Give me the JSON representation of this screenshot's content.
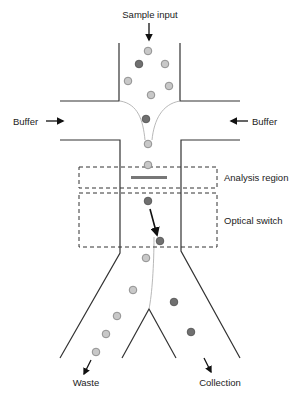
{
  "diagram": {
    "labels": {
      "sample_input": "Sample input",
      "buffer_left": "Buffer",
      "buffer_right": "Buffer",
      "analysis_region": "Analysis region",
      "optical_switch": "Optical switch",
      "waste": "Waste",
      "collection": "Collection"
    },
    "colors": {
      "wall": "#333333",
      "particle_light_fill": "#c8c8c8",
      "particle_light_stroke": "#888888",
      "particle_dark_fill": "#707070",
      "particle_dark_stroke": "#555555",
      "dashed_box": "#333333",
      "stream_line": "#b0b0b0",
      "detector_bar": "#777777"
    },
    "particles": [
      {
        "x": 148,
        "y": 51,
        "type": "light"
      },
      {
        "x": 139,
        "y": 64,
        "type": "dark"
      },
      {
        "x": 165,
        "y": 64,
        "type": "light"
      },
      {
        "x": 128,
        "y": 81,
        "type": "light"
      },
      {
        "x": 169,
        "y": 86,
        "type": "light"
      },
      {
        "x": 151,
        "y": 95,
        "type": "light"
      },
      {
        "x": 146,
        "y": 119,
        "type": "dark"
      },
      {
        "x": 148,
        "y": 144,
        "type": "light"
      },
      {
        "x": 148,
        "y": 165,
        "type": "light"
      },
      {
        "x": 148,
        "y": 201,
        "type": "dark"
      },
      {
        "x": 160,
        "y": 241,
        "type": "dark"
      },
      {
        "x": 146,
        "y": 258,
        "type": "light"
      },
      {
        "x": 133,
        "y": 290,
        "type": "light"
      },
      {
        "x": 117,
        "y": 316,
        "type": "light"
      },
      {
        "x": 106,
        "y": 334,
        "type": "light"
      },
      {
        "x": 96,
        "y": 352,
        "type": "light"
      },
      {
        "x": 174,
        "y": 302,
        "type": "dark"
      },
      {
        "x": 191,
        "y": 332,
        "type": "dark"
      }
    ]
  }
}
